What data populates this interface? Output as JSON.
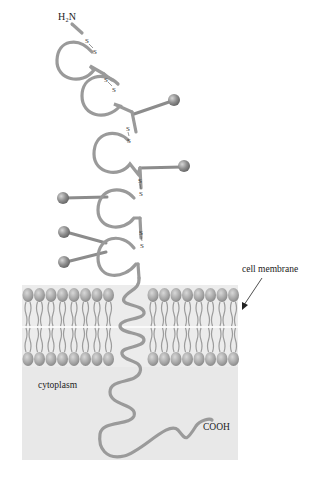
{
  "diagram": {
    "type": "transmembrane-protein",
    "labels": {
      "n_terminus": "H₂N",
      "c_terminus": "COOH",
      "membrane": "cell membrane",
      "cytoplasm": "cytoplasm",
      "disulfide": "S"
    },
    "counts": {
      "extracellular_loops": 5,
      "disulfide_bonds": 5,
      "carbohydrate_side_chains": 6,
      "membrane_lipids_per_leaflet_left": 8,
      "membrane_lipids_per_leaflet_right": 8
    },
    "colors": {
      "protein": "#9a9a9a",
      "sphere": "#8a8a8a",
      "membrane_head": "#a8a8a8",
      "cytoplasm_bg": "#e6e6e6",
      "text": "#222222"
    }
  }
}
